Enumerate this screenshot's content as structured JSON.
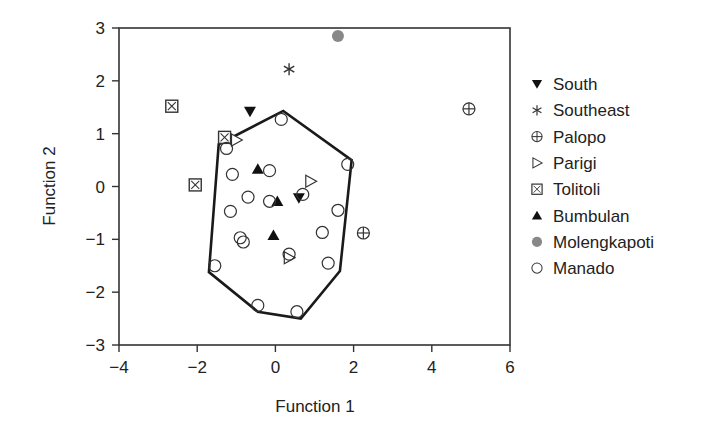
{
  "chart_data": {
    "type": "scatter",
    "title": "",
    "xlabel": "Function 1",
    "ylabel": "Function 2",
    "xlim": [
      -4,
      6
    ],
    "ylim": [
      -3,
      3
    ],
    "xticks": [
      -4,
      -2,
      0,
      2,
      4,
      6
    ],
    "yticks": [
      -3,
      -2,
      -1,
      0,
      1,
      2,
      3
    ],
    "xtick_labels": [
      "−4",
      "−2",
      "0",
      "2",
      "4",
      "6"
    ],
    "ytick_labels": [
      "−3",
      "−2",
      "−1",
      "0",
      "1",
      "2",
      "3"
    ],
    "grid": false,
    "legend_position": "right",
    "series": [
      {
        "name": "South",
        "marker": "triangle-down-filled",
        "color": "#111111",
        "points": [
          [
            -0.65,
            1.42
          ],
          [
            0.6,
            -0.22
          ]
        ]
      },
      {
        "name": "Southeast",
        "marker": "asterisk",
        "color": "#333333",
        "points": [
          [
            0.35,
            2.22
          ]
        ]
      },
      {
        "name": "Palopo",
        "marker": "circle-plus",
        "color": "#333333",
        "points": [
          [
            4.95,
            1.47
          ],
          [
            2.25,
            -0.88
          ]
        ]
      },
      {
        "name": "Parigi",
        "marker": "triangle-right-open",
        "color": "#333333",
        "points": [
          [
            -1.0,
            0.88
          ],
          [
            0.9,
            0.1
          ],
          [
            0.35,
            -1.35
          ]
        ]
      },
      {
        "name": "Tolitoli",
        "marker": "square-x",
        "color": "#333333",
        "points": [
          [
            -2.65,
            1.52
          ],
          [
            -2.05,
            0.03
          ],
          [
            -1.3,
            0.93
          ]
        ]
      },
      {
        "name": "Bumbulan",
        "marker": "triangle-up-filled",
        "color": "#111111",
        "points": [
          [
            -0.45,
            0.33
          ],
          [
            0.05,
            -0.28
          ],
          [
            -0.05,
            -0.92
          ]
        ]
      },
      {
        "name": "Molengkapoti",
        "marker": "circle-filled",
        "color": "#888888",
        "points": [
          [
            1.6,
            2.85
          ]
        ]
      },
      {
        "name": "Manado",
        "marker": "circle-open",
        "color": "#333333",
        "points": [
          [
            0.15,
            1.27
          ],
          [
            -1.25,
            0.72
          ],
          [
            -1.1,
            0.23
          ],
          [
            -0.7,
            -0.2
          ],
          [
            -0.15,
            0.3
          ],
          [
            -0.15,
            -0.28
          ],
          [
            -1.15,
            -0.47
          ],
          [
            -0.9,
            -0.97
          ],
          [
            -0.82,
            -1.05
          ],
          [
            0.35,
            -1.28
          ],
          [
            0.7,
            -0.15
          ],
          [
            1.2,
            -0.87
          ],
          [
            1.6,
            -0.45
          ],
          [
            1.85,
            0.42
          ],
          [
            -1.55,
            -1.5
          ],
          [
            1.35,
            -1.45
          ],
          [
            -0.45,
            -2.25
          ],
          [
            0.55,
            -2.37
          ]
        ]
      }
    ],
    "hull": {
      "series": "Manado",
      "vertices": [
        [
          -1.45,
          0.8
        ],
        [
          0.2,
          1.43
        ],
        [
          1.95,
          0.5
        ],
        [
          1.65,
          -1.6
        ],
        [
          0.65,
          -2.5
        ],
        [
          -0.45,
          -2.37
        ],
        [
          -1.7,
          -1.62
        ]
      ]
    }
  }
}
